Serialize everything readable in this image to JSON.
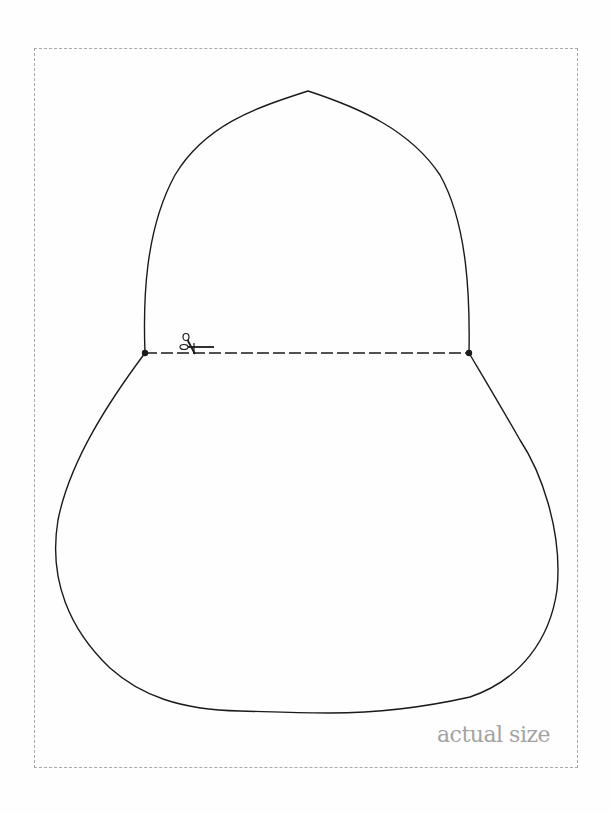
{
  "page": {
    "type": "printable sewing/craft pattern template",
    "background_color": "#ffffff"
  },
  "border": {
    "style": "dashed",
    "color": "#a9a9a9"
  },
  "pattern": {
    "outline_color": "#1a1a1a",
    "upper_piece": "pointed dome / arch shape",
    "lower_piece": "rounded pear / bag body shape",
    "cut_line": {
      "style": "dashed",
      "color": "#1a1a1a",
      "endpoints": [
        "left-dot",
        "right-dot"
      ]
    },
    "icons": [
      "scissors-icon",
      "left-dot",
      "right-dot"
    ]
  },
  "label": {
    "text": "actual size",
    "color": "#a3a3a3"
  }
}
